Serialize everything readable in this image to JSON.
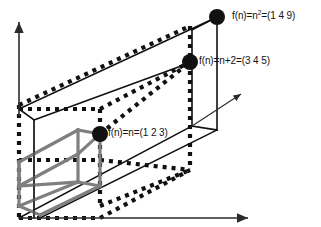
{
  "figure": {
    "title": "",
    "background_color": "#ffffff",
    "width": 321,
    "height": 227
  },
  "axes": {
    "color": "#2b2b2b",
    "vertical": {
      "name": "vertical-axis",
      "x1": 19,
      "y1": 116,
      "x2": 19,
      "y2": 22
    },
    "horizontal": {
      "name": "horizontal-axis",
      "x1": 19,
      "y1": 218,
      "x2": 250,
      "y2": 218
    },
    "depth": {
      "name": "depth-axis",
      "x1": 192,
      "y1": 126,
      "x2": 243,
      "y2": 92
    }
  },
  "boxes": [
    {
      "name": "inner-gray-box",
      "style": "solid",
      "color": "#7f7f7f",
      "stroke_width": 3.2,
      "label_ref": "f(n)=n=(1 2 3)"
    },
    {
      "name": "middle-dotted-box",
      "style": "dotted",
      "color": "#111111",
      "stroke_width": 4.2,
      "label_ref": "f(n)=n+2=(3 4 5)"
    },
    {
      "name": "outer-solid-box",
      "style": "solid",
      "color": "#111111",
      "stroke_width": 1.6,
      "label_ref": "f(n)=n²=(1 4 9)"
    }
  ],
  "points": [
    {
      "name": "point-n-squared",
      "label_html": "f(n)=n<sup>2</sup>=(1 4 9)",
      "label_text": "f(n)=n2=(1 4 9)",
      "function": "f(n)=n^2",
      "vector": "(1 4 9)",
      "x": 217,
      "y": 17,
      "radius": 8,
      "color": "#111111",
      "label_x": 232,
      "label_y": 12
    },
    {
      "name": "point-n-plus-2",
      "label_html": "f(n)=n+2=(3 4 5)",
      "label_text": "f(n)=n+2=(3 4 5)",
      "function": "f(n)=n+2",
      "vector": "(3 4 5)",
      "x": 190,
      "y": 62,
      "radius": 8,
      "color": "#111111",
      "label_x": 199,
      "label_y": 57
    },
    {
      "name": "point-n",
      "label_html": "f(n)=n=(1 2 3)",
      "label_text": "f(n)=n=(1 2 3)",
      "function": "f(n)=n",
      "vector": "(1 2 3)",
      "x": 100,
      "y": 134,
      "radius": 8,
      "color": "#111111",
      "label_x": 108,
      "label_y": 129
    }
  ]
}
